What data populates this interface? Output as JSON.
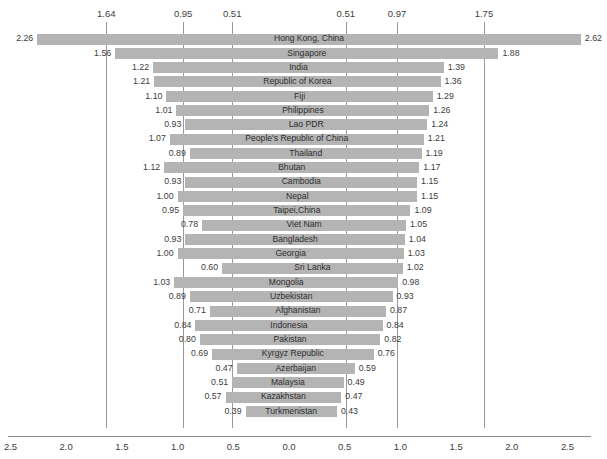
{
  "chart_data": {
    "type": "bar",
    "orientation": "horizontal-diverging",
    "title": "",
    "xlabel": "",
    "ylabel": "",
    "xlim": [
      -2.5,
      2.5
    ],
    "grid": false,
    "axis_center_value": 0.0,
    "bottom_axis_ticks": [
      {
        "label": "2.5",
        "value": -2.5
      },
      {
        "label": "2.0",
        "value": -2.0
      },
      {
        "label": "1.5",
        "value": -1.5
      },
      {
        "label": "1.0",
        "value": -1.0
      },
      {
        "label": "0.5",
        "value": -0.5
      },
      {
        "label": "0.0",
        "value": 0.0
      },
      {
        "label": "0.5",
        "value": 0.5
      },
      {
        "label": "1.0",
        "value": 1.0
      },
      {
        "label": "1.5",
        "value": 1.5
      },
      {
        "label": "2.0",
        "value": 2.0
      },
      {
        "label": "2.5",
        "value": 2.5
      }
    ],
    "reference_lines": [
      {
        "label": "1.64",
        "value": -1.64
      },
      {
        "label": "0.95",
        "value": -0.95
      },
      {
        "label": "0.51",
        "value": -0.51
      },
      {
        "label": "0.51",
        "value": 0.51
      },
      {
        "label": "0.97",
        "value": 0.97
      },
      {
        "label": "1.75",
        "value": 1.75
      }
    ],
    "categories": [
      "Hong Kong, China",
      "Singapore",
      "India",
      "Republic of Korea",
      "Fiji",
      "Philippines",
      "Lao PDR",
      "People's Republic of China",
      "Thailand",
      "Bhutan",
      "Cambodia",
      "Nepal",
      "Taipei,China",
      "Viet Nam",
      "Bangladesh",
      "Georgia",
      "Sri Lanka",
      "Mongolia",
      "Uzbekistan",
      "Afghanistan",
      "Indonesia",
      "Pakistan",
      "Kyrgyz Republic",
      "Azerbaijan",
      "Malaysia",
      "Kazakhstan",
      "Turkmenistan"
    ],
    "series": [
      {
        "name": "left",
        "values": [
          2.26,
          1.56,
          1.22,
          1.21,
          1.1,
          1.01,
          0.93,
          1.07,
          0.89,
          1.12,
          0.93,
          1.0,
          0.95,
          0.78,
          0.93,
          1.0,
          0.6,
          1.03,
          0.89,
          0.71,
          0.84,
          0.8,
          0.69,
          0.47,
          0.51,
          0.57,
          0.39
        ]
      },
      {
        "name": "right",
        "values": [
          2.62,
          1.88,
          1.39,
          1.36,
          1.29,
          1.26,
          1.24,
          1.21,
          1.19,
          1.17,
          1.15,
          1.15,
          1.09,
          1.05,
          1.04,
          1.03,
          1.02,
          0.98,
          0.93,
          0.87,
          0.84,
          0.82,
          0.76,
          0.59,
          0.49,
          0.47,
          0.43
        ]
      }
    ],
    "labels": {
      "left": [
        "2.26",
        "1.56",
        "1.22",
        "1.21",
        "1.10",
        "1.01",
        "0.93",
        "1.07",
        "0.89",
        "1.12",
        "0.93",
        "1.00",
        "0.95",
        "0.78",
        "0.93",
        "1.00",
        "0.60",
        "1.03",
        "0.89",
        "0.71",
        "0.84",
        "0.80",
        "0.69",
        "0.47",
        "0.51",
        "0.57",
        "0.39"
      ],
      "right": [
        "2.62",
        "1.88",
        "1.39",
        "1.36",
        "1.29",
        "1.26",
        "1.24",
        "1.21",
        "1.19",
        "1.17",
        "1.15",
        "1.15",
        "1.09",
        "1.05",
        "1.04",
        "1.03",
        "1.02",
        "0.98",
        "0.93",
        "0.87",
        "0.84",
        "0.82",
        "0.76",
        "0.59",
        "0.49",
        "0.47",
        "0.43"
      ]
    },
    "colors": {
      "bar": "#b4b4b4",
      "reference_line": "#9a9a9a",
      "axis_line": "#8d8d8d",
      "text": "#3d3d3d",
      "background": "#ffffff"
    }
  }
}
